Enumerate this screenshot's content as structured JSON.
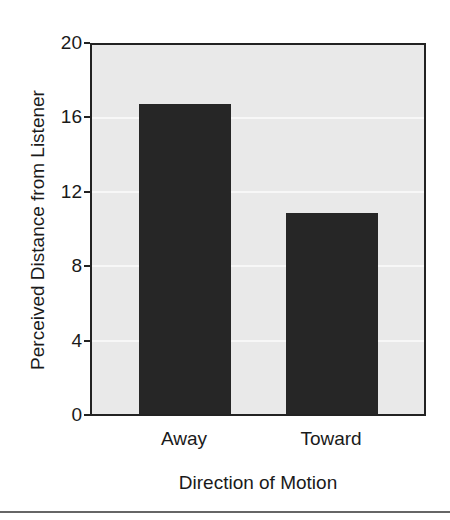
{
  "chart_data": {
    "type": "bar",
    "title": "",
    "xlabel": "Direction of Motion",
    "ylabel": "Perceived Distance from Listener",
    "categories": [
      "Away",
      "Toward"
    ],
    "values": [
      16.8,
      10.9
    ],
    "ylim": [
      0,
      20
    ],
    "yticks": [
      0,
      4,
      8,
      12,
      16,
      20
    ],
    "grid": true,
    "legend": null,
    "colors": {
      "bar": "#262626",
      "plot_bg": "#e9e9e9",
      "gridline": "#f7f7f7",
      "axis": "#222222"
    }
  },
  "labels": {
    "yticks": [
      "0",
      "4",
      "8",
      "12",
      "16",
      "20"
    ],
    "xticks": [
      "Away",
      "Toward"
    ],
    "xtitle": "Direction of Motion",
    "ytitle": "Perceived Distance from Listener"
  }
}
